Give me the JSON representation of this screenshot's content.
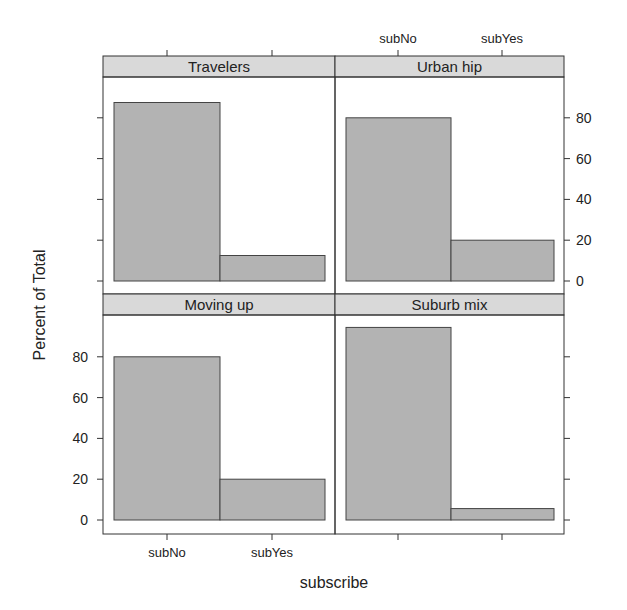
{
  "chart_data": {
    "type": "bar",
    "layout": "lattice 2x2 panels",
    "title": "",
    "xlabel": "subscribe",
    "ylabel": "Percent of Total",
    "categories": [
      "subNo",
      "subYes"
    ],
    "ylim": [
      -3,
      100
    ],
    "yticks": [
      0,
      20,
      40,
      60,
      80
    ],
    "grid": false,
    "legend": null,
    "panels": [
      {
        "name": "Travelers",
        "row": 0,
        "col": 0,
        "values": [
          87.5,
          12.5
        ]
      },
      {
        "name": "Urban hip",
        "row": 0,
        "col": 1,
        "values": [
          80,
          20
        ]
      },
      {
        "name": "Moving up",
        "row": 1,
        "col": 0,
        "values": [
          80,
          20
        ]
      },
      {
        "name": "Suburb mix",
        "row": 1,
        "col": 1,
        "values": [
          94.4,
          5.6
        ]
      }
    ],
    "colors": {
      "bar_fill": "#b3b3b3",
      "bar_stroke": "#444444",
      "strip_fill": "#d9d9d9",
      "frame": "#333333"
    }
  }
}
